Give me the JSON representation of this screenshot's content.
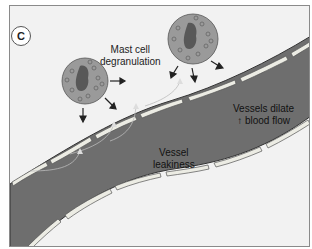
{
  "figure": {
    "panel_label": "C",
    "labels": {
      "mast_cell": [
        "Mast cell",
        "degranulation"
      ],
      "vessel_leakiness": [
        "Vessel",
        "leakiness"
      ],
      "vessels_dilate": [
        "Vessels dilate",
        "↑ blood flow"
      ]
    },
    "colors": {
      "background": "#f2f2f2",
      "vessel_lumen": "#6e6e6e",
      "endothelial_cell": "#e8e8e0",
      "mast_cell": "#9a9a9a",
      "granule": "#7c7c7c",
      "nucleus": "#585858"
    }
  }
}
